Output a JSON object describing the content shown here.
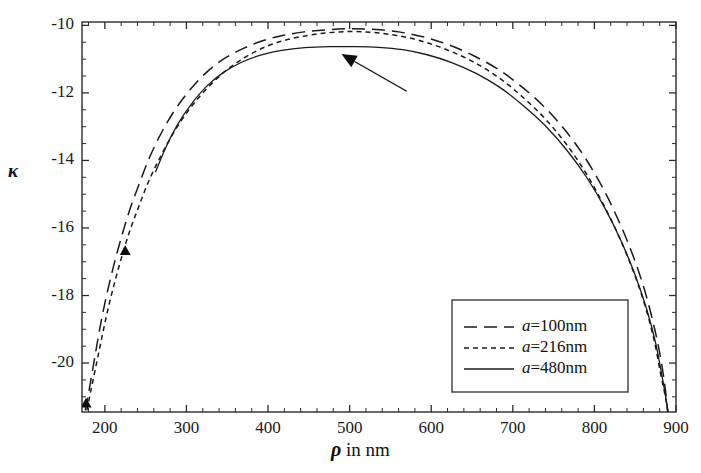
{
  "chart_data": {
    "type": "line",
    "title": "",
    "xlabel": "ρ in nm",
    "xlabel_symbol": "ρ",
    "xlabel_rest": " in nm",
    "ylabel": "κ",
    "xlim": [
      172,
      900
    ],
    "ylim": [
      -21.45,
      -9.9
    ],
    "grid": false,
    "legend_position": "lower-right",
    "xticks": [
      200,
      300,
      400,
      500,
      600,
      700,
      800,
      900
    ],
    "xtick_labels": [
      "200",
      "300",
      "400",
      "500",
      "600",
      "700",
      "800",
      "900"
    ],
    "xminor_step": 20,
    "yticks": [
      -10,
      -12,
      -14,
      -16,
      -18,
      -20
    ],
    "ytick_labels": [
      "-10",
      "-12",
      "-14",
      "-16",
      "-18",
      "-20"
    ],
    "yminor_step": 0.5,
    "series": [
      {
        "name": "a=100nm",
        "label_italic": "a",
        "label_rest": "=100nm",
        "style": "long-dash",
        "color": "#1a1a1a",
        "points": [
          [
            176,
            -21.4
          ],
          [
            180,
            -20.9
          ],
          [
            185,
            -20.2
          ],
          [
            190,
            -19.5
          ],
          [
            196,
            -18.7
          ],
          [
            203,
            -17.9
          ],
          [
            211,
            -17.1
          ],
          [
            220,
            -16.3
          ],
          [
            230,
            -15.5
          ],
          [
            242,
            -14.7
          ],
          [
            255,
            -13.9
          ],
          [
            270,
            -13.15
          ],
          [
            286,
            -12.5
          ],
          [
            303,
            -11.95
          ],
          [
            322,
            -11.45
          ],
          [
            342,
            -11.05
          ],
          [
            364,
            -10.75
          ],
          [
            388,
            -10.5
          ],
          [
            414,
            -10.32
          ],
          [
            442,
            -10.2
          ],
          [
            472,
            -10.13
          ],
          [
            502,
            -10.1
          ],
          [
            532,
            -10.12
          ],
          [
            562,
            -10.2
          ],
          [
            592,
            -10.35
          ],
          [
            622,
            -10.58
          ],
          [
            652,
            -10.9
          ],
          [
            682,
            -11.3
          ],
          [
            710,
            -11.8
          ],
          [
            738,
            -12.4
          ],
          [
            764,
            -13.1
          ],
          [
            788,
            -13.9
          ],
          [
            810,
            -14.8
          ],
          [
            830,
            -15.8
          ],
          [
            847,
            -16.8
          ],
          [
            861,
            -17.8
          ],
          [
            872,
            -18.8
          ],
          [
            880,
            -19.7
          ],
          [
            886,
            -20.6
          ],
          [
            890,
            -21.45
          ]
        ]
      },
      {
        "name": "a=216nm",
        "label_italic": "a",
        "label_rest": "=216nm",
        "style": "short-dash",
        "color": "#1a1a1a",
        "points": [
          [
            178,
            -21.4
          ],
          [
            183,
            -20.8
          ],
          [
            189,
            -20.1
          ],
          [
            195,
            -19.4
          ],
          [
            202,
            -18.6
          ],
          [
            210,
            -17.8
          ],
          [
            219,
            -17.0
          ],
          [
            229,
            -16.2
          ],
          [
            241,
            -15.4
          ],
          [
            254,
            -14.6
          ],
          [
            269,
            -13.85
          ],
          [
            285,
            -13.15
          ],
          [
            303,
            -12.5
          ],
          [
            322,
            -11.95
          ],
          [
            343,
            -11.45
          ],
          [
            365,
            -11.05
          ],
          [
            389,
            -10.72
          ],
          [
            415,
            -10.48
          ],
          [
            443,
            -10.32
          ],
          [
            473,
            -10.22
          ],
          [
            503,
            -10.18
          ],
          [
            533,
            -10.22
          ],
          [
            563,
            -10.32
          ],
          [
            593,
            -10.5
          ],
          [
            623,
            -10.76
          ],
          [
            653,
            -11.1
          ],
          [
            683,
            -11.55
          ],
          [
            711,
            -12.1
          ],
          [
            739,
            -12.75
          ],
          [
            765,
            -13.5
          ],
          [
            789,
            -14.35
          ],
          [
            811,
            -15.3
          ],
          [
            831,
            -16.3
          ],
          [
            848,
            -17.3
          ],
          [
            862,
            -18.3
          ],
          [
            873,
            -19.3
          ],
          [
            881,
            -20.3
          ],
          [
            887,
            -21.0
          ],
          [
            890,
            -21.45
          ]
        ]
      },
      {
        "name": "a=480nm",
        "label_italic": "a",
        "label_rest": "=480nm",
        "style": "solid",
        "color": "#1a1a1a",
        "points": [
          [
            262,
            -14.35
          ],
          [
            275,
            -13.6
          ],
          [
            290,
            -12.9
          ],
          [
            307,
            -12.3
          ],
          [
            325,
            -11.8
          ],
          [
            345,
            -11.4
          ],
          [
            367,
            -11.1
          ],
          [
            391,
            -10.88
          ],
          [
            417,
            -10.74
          ],
          [
            445,
            -10.66
          ],
          [
            475,
            -10.63
          ],
          [
            505,
            -10.63
          ],
          [
            535,
            -10.65
          ],
          [
            565,
            -10.72
          ],
          [
            595,
            -10.87
          ],
          [
            625,
            -11.1
          ],
          [
            655,
            -11.42
          ],
          [
            685,
            -11.85
          ],
          [
            713,
            -12.38
          ],
          [
            741,
            -13.0
          ],
          [
            767,
            -13.72
          ],
          [
            791,
            -14.52
          ],
          [
            813,
            -15.42
          ],
          [
            833,
            -16.4
          ],
          [
            850,
            -17.4
          ],
          [
            864,
            -18.4
          ],
          [
            875,
            -19.4
          ],
          [
            883,
            -20.4
          ],
          [
            888,
            -21.1
          ],
          [
            890,
            -21.45
          ]
        ]
      }
    ],
    "markers": [
      {
        "name": "triangle-marker-upper",
        "shape": "triangle",
        "x": 225,
        "y": -16.68
      },
      {
        "name": "triangle-marker-lower",
        "shape": "triangle",
        "x": 177,
        "y": -21.2
      }
    ],
    "annotations": [
      {
        "name": "arrow-annotation",
        "shape": "arrow",
        "tip_x": 490,
        "tip_y": -10.85,
        "tail_x": 570,
        "tail_y": -11.95
      }
    ]
  }
}
